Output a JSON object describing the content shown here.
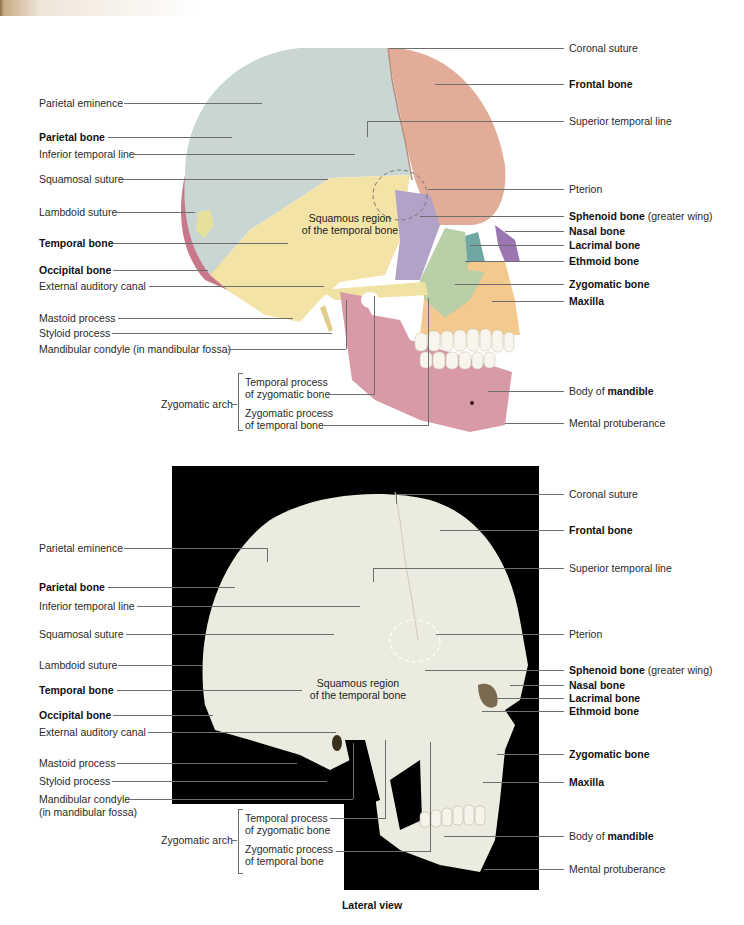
{
  "caption": "Lateral view",
  "colors": {
    "parietal": "#c9d6d4",
    "frontal": "#e2ad98",
    "temporal": "#f3e3a6",
    "occipital": "#c9788c",
    "sphenoid": "#b3a2c8",
    "zygomatic": "#b9cfa8",
    "maxilla": "#f3c98e",
    "mandible": "#d99aa8",
    "nasal": "#9c76b3",
    "photo_bg": "#000000",
    "bone_photo": "#ecebdf"
  },
  "top_diagram": {
    "inner_label": [
      "Squamous region",
      "of the temporal bone"
    ],
    "left_labels": [
      {
        "text": "Parietal eminence",
        "bold": false
      },
      {
        "text": "Parietal bone",
        "bold": true
      },
      {
        "text": "Inferior temporal line",
        "bold": false
      },
      {
        "text": "Squamosal suture",
        "bold": false
      },
      {
        "text": "Lambdoid suture",
        "bold": false
      },
      {
        "text": "Temporal bone",
        "bold": true
      },
      {
        "text": "Occipital bone",
        "bold": true
      },
      {
        "text": "External auditory canal",
        "bold": false
      },
      {
        "text": "Mastoid process",
        "bold": false
      },
      {
        "text": "Styloid process",
        "bold": false
      },
      {
        "text": "Mandibular condyle (in mandibular fossa)",
        "bold": false
      }
    ],
    "zygomatic_arch": {
      "label": "Zygomatic arch",
      "parts": [
        [
          "Temporal process",
          "of zygomatic bone"
        ],
        [
          "Zygomatic process",
          "of temporal bone"
        ]
      ]
    },
    "right_labels": [
      {
        "text": "Coronal suture",
        "bold": false
      },
      {
        "text": "Frontal bone",
        "bold": true
      },
      {
        "text": "Superior temporal line",
        "bold": false
      },
      {
        "text": "Pterion",
        "bold": false
      },
      {
        "text": "Sphenoid bone",
        "bold": true,
        "suffix": " (greater wing)"
      },
      {
        "text": "Nasal bone",
        "bold": true
      },
      {
        "text": "Lacrimal bone",
        "bold": true
      },
      {
        "text": "Ethmoid bone",
        "bold": true
      },
      {
        "text": "Zygomatic bone",
        "bold": true
      },
      {
        "text": "Maxilla",
        "bold": true
      },
      {
        "prefix": "Body of ",
        "text": "mandible",
        "bold": true
      },
      {
        "text": "Mental protuberance",
        "bold": false
      }
    ]
  },
  "bottom_photo": {
    "inner_label": [
      "Squamous region",
      "of the temporal bone"
    ],
    "left_labels": [
      {
        "text": "Parietal eminence",
        "bold": false
      },
      {
        "text": "Parietal bone",
        "bold": true
      },
      {
        "text": "Inferior temporal line",
        "bold": false
      },
      {
        "text": "Squamosal suture",
        "bold": false
      },
      {
        "text": "Lambdoid suture",
        "bold": false
      },
      {
        "text": "Temporal bone",
        "bold": true
      },
      {
        "text": "Occipital bone",
        "bold": true
      },
      {
        "text": "External auditory canal",
        "bold": false
      },
      {
        "text": "Mastoid process",
        "bold": false
      },
      {
        "text": "Styloid process",
        "bold": false
      },
      {
        "text": "Mandibular condyle",
        "bold": false
      },
      {
        "text": "(in mandibular fossa)",
        "bold": false
      }
    ],
    "zygomatic_arch": {
      "label": "Zygomatic arch",
      "parts": [
        [
          "Temporal process",
          "of zygomatic bone"
        ],
        [
          "Zygomatic process",
          "of temporal bone"
        ]
      ]
    },
    "right_labels": [
      {
        "text": "Coronal suture",
        "bold": false
      },
      {
        "text": "Frontal bone",
        "bold": true
      },
      {
        "text": "Superior temporal line",
        "bold": false
      },
      {
        "text": "Pterion",
        "bold": false
      },
      {
        "text": "Sphenoid bone",
        "bold": true,
        "suffix": " (greater wing)"
      },
      {
        "text": "Nasal bone",
        "bold": true
      },
      {
        "text": "Lacrimal bone",
        "bold": true
      },
      {
        "text": "Ethmoid bone",
        "bold": true
      },
      {
        "text": "Zygomatic bone",
        "bold": true
      },
      {
        "text": "Maxilla",
        "bold": true
      },
      {
        "prefix": "Body of ",
        "text": "mandible",
        "bold": true
      },
      {
        "text": "Mental protuberance",
        "bold": false
      }
    ]
  }
}
